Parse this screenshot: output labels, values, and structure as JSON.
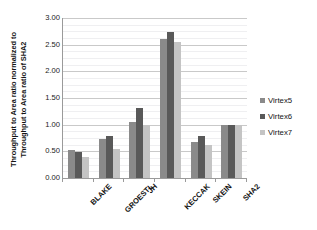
{
  "top_fragment": "",
  "chart_data": {
    "type": "bar",
    "title": "",
    "xlabel": "",
    "ylabel": "Throughput to Area ratio normalized to Throughput to Area ratio of SHA2",
    "ylabel_lines": [
      "Throughput to Area ratio normalized to",
      "Throughput to Area ratio of SHA2"
    ],
    "categories": [
      "BLAKE",
      "GROESTL",
      "JH",
      "KECCAK",
      "SKEIN",
      "SHA2"
    ],
    "series": [
      {
        "name": "Virtex5",
        "color": "#8a8a8a",
        "values": [
          0.53,
          0.74,
          1.05,
          2.6,
          0.67,
          1.0
        ]
      },
      {
        "name": "Virtex6",
        "color": "#595959",
        "values": [
          0.48,
          0.79,
          1.32,
          2.73,
          0.79,
          1.0
        ]
      },
      {
        "name": "Virtex7",
        "color": "#c4c4c4",
        "values": [
          0.4,
          0.55,
          1.0,
          2.55,
          0.62,
          1.0
        ]
      }
    ],
    "ylim": [
      0,
      3.0
    ],
    "ytick_step": 0.5,
    "yticks": [
      0.0,
      0.5,
      1.0,
      1.5,
      2.0,
      2.5,
      3.0
    ],
    "ytick_labels": [
      "0.00",
      "0.50",
      "1.00",
      "1.50",
      "2.00",
      "2.50",
      "3.00"
    ],
    "minor_gridlines": true,
    "minor_ytick_step": 0.125,
    "grid": true,
    "legend_position": "right",
    "legend_entries": [
      "Virtex5",
      "Virtex6",
      "Virtex7"
    ]
  }
}
